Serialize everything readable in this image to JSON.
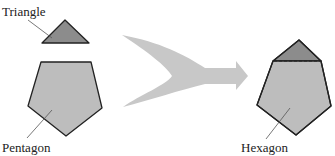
{
  "diagram": {
    "labels": {
      "triangle": "Triangle",
      "pentagon": "Pentagon",
      "hexagon": "Hexagon"
    },
    "colors": {
      "triangle_fill": "#8c8c8c",
      "polygon_fill": "#bdbdbd",
      "arrow_fill": "#c8c8c8",
      "outline": "#222222"
    }
  }
}
